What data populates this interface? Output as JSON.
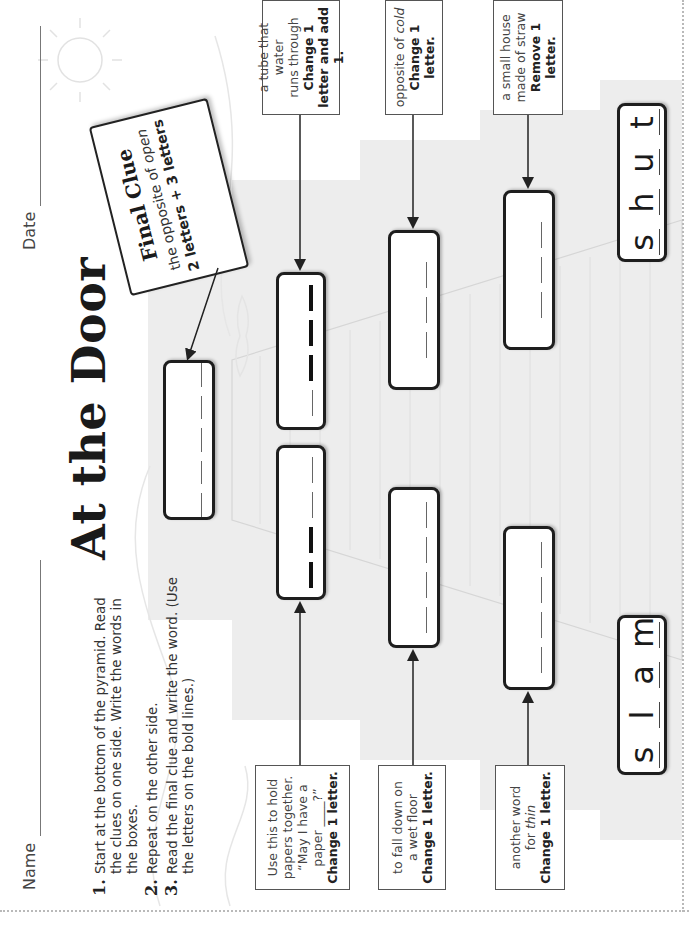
{
  "header": {
    "name_label": "Name",
    "date_label": "Date",
    "title": "At the Door"
  },
  "instructions": [
    {
      "num": "1.",
      "text": "Start at the bottom of the pyramid. Read the clues on one side. Write the words in the boxes."
    },
    {
      "num": "2.",
      "text": "Repeat on the other side."
    },
    {
      "num": "3.",
      "text": "Read the final clue and write the word. (Use the letters on the bold lines.)"
    }
  ],
  "final_clue": {
    "title": "Final Clue",
    "text_prefix": "the opposite of ",
    "text_emph": "open",
    "hint": "2 letters + 3 letters",
    "slots": 5
  },
  "left_side": {
    "start_word": [
      "s",
      "l",
      "a",
      "m"
    ],
    "clues": [
      {
        "line1": "another word",
        "line2_prefix": "for ",
        "line2_emph": "thin",
        "instruction": "Change 1 letter.",
        "slots": [
          "thin",
          "thin",
          "thin",
          "thin"
        ]
      },
      {
        "line1": "to fall down on",
        "line2_prefix": "a wet floor",
        "line2_emph": "",
        "instruction": "Change 1 letter.",
        "slots": [
          "thin",
          "thin",
          "thin",
          "thin"
        ]
      },
      {
        "line1": "Use this to hold papers together.",
        "line2_prefix": "“May I have a paper ____?”",
        "line2_emph": "",
        "instruction": "Change 1 letter.",
        "slots": [
          "bold",
          "bold",
          "thin",
          "thin"
        ]
      }
    ]
  },
  "right_side": {
    "start_word": [
      "s",
      "h",
      "u",
      "t"
    ],
    "clues": [
      {
        "line1": "a small house",
        "line2_prefix": "made of straw",
        "line2_emph": "",
        "instruction": "Remove 1 letter.",
        "slots": [
          "thin",
          "thin",
          "thin"
        ]
      },
      {
        "line1": "opposite of ",
        "line2_prefix": "",
        "line2_emph": "cold",
        "instruction": "Change 1 letter.",
        "slots": [
          "thin",
          "thin",
          "thin"
        ]
      },
      {
        "line1": "a tube that water",
        "line2_prefix": "runs through",
        "line2_emph": "",
        "instruction": "Change 1 letter and add 1.",
        "slots": [
          "thin",
          "bold",
          "bold",
          "bold"
        ]
      }
    ]
  },
  "colors": {
    "pyramid_fill": "#ededed",
    "box_border": "#1e1e1e",
    "page_border": "#b9b9b9"
  }
}
